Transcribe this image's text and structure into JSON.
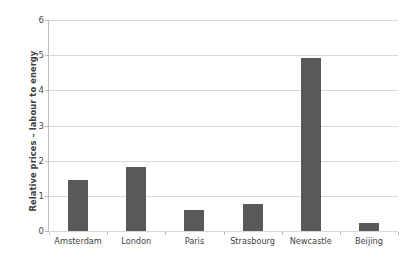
{
  "chart_data": {
    "type": "bar",
    "title": "",
    "subtitle": "",
    "xlabel": "",
    "ylabel": "Relative prices – labour to energy",
    "categories": [
      "Amsterdam",
      "London",
      "Paris",
      "Strasbourg",
      "Newcastle",
      "Beijing"
    ],
    "values": [
      1.45,
      1.82,
      0.6,
      0.77,
      4.92,
      0.23
    ],
    "series": [
      {
        "name": "Relative prices – labour to energy",
        "values": [
          1.45,
          1.82,
          0.6,
          0.77,
          4.92,
          0.23
        ]
      }
    ],
    "ylim": [
      0,
      6
    ],
    "ytick_labels": [
      "0",
      "1",
      "2",
      "3",
      "4",
      "5",
      "6"
    ],
    "ytick_values": [
      0,
      1,
      2,
      3,
      4,
      5,
      6
    ],
    "grid": true,
    "grid_axis": "y",
    "legend": false,
    "legend_position": "none",
    "bar_color": "#595959",
    "grid_color": "#d9d9d9",
    "axis_color": "#bfbfbf",
    "background_color": "#ffffff",
    "text_color": "#3f3f3f"
  }
}
